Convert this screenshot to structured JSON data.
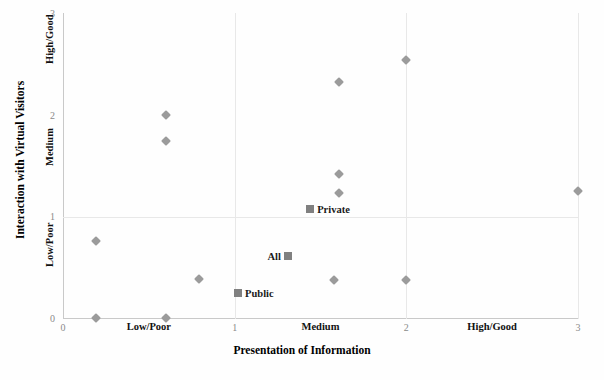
{
  "chart_data": {
    "type": "scatter",
    "title": "",
    "xlabel": "Presentation of Information",
    "ylabel": "Interaction with Virtual Visitors",
    "xlim": [
      0,
      3
    ],
    "ylim": [
      0,
      3
    ],
    "grid": true,
    "x_ticks": [
      0,
      1,
      2,
      3
    ],
    "y_ticks": [
      0,
      1,
      2,
      3
    ],
    "x_tick_labels": [
      "0",
      "1",
      "2",
      "3"
    ],
    "y_tick_labels": [
      "0",
      "1",
      "2",
      "3"
    ],
    "x_category_labels": [
      {
        "label": "Low/Poor",
        "x": 0.5
      },
      {
        "label": "Medium",
        "x": 1.5
      },
      {
        "label": "High/Good",
        "x": 2.5
      }
    ],
    "y_category_labels": [
      {
        "label": "Low/Poor",
        "y": 0.5
      },
      {
        "label": "Medium",
        "y": 1.5
      },
      {
        "label": "High/Good",
        "y": 2.5
      }
    ],
    "series": [
      {
        "name": "museums",
        "marker": "diamond",
        "color": "#9b9b9b",
        "points": [
          {
            "x": 0.19,
            "y": 0.0
          },
          {
            "x": 0.6,
            "y": 0.0
          },
          {
            "x": 0.19,
            "y": 0.76
          },
          {
            "x": 0.79,
            "y": 0.38
          },
          {
            "x": 0.6,
            "y": 1.74
          },
          {
            "x": 0.6,
            "y": 2.0
          },
          {
            "x": 1.58,
            "y": 0.37
          },
          {
            "x": 1.61,
            "y": 1.23
          },
          {
            "x": 1.61,
            "y": 1.42
          },
          {
            "x": 1.61,
            "y": 2.32
          },
          {
            "x": 2.0,
            "y": 0.37
          },
          {
            "x": 2.0,
            "y": 2.54
          },
          {
            "x": 3.0,
            "y": 1.25
          }
        ]
      },
      {
        "name": "averages",
        "marker": "square",
        "color": "#808080",
        "points": [
          {
            "x": 1.44,
            "y": 1.07,
            "label": "Private",
            "label_side": "right"
          },
          {
            "x": 1.31,
            "y": 0.61,
            "label": "All",
            "label_side": "left"
          },
          {
            "x": 1.02,
            "y": 0.25,
            "label": "Public",
            "label_side": "right"
          }
        ]
      }
    ]
  },
  "axes": {
    "x_title": "Presentation of Information",
    "y_title": "Interaction with Virtual Visitors"
  }
}
